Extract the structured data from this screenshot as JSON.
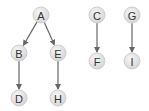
{
  "diagram": {
    "type": "directed-forest",
    "colors": {
      "node_fill": "#e4e4e4",
      "node_stroke": "#cfcfcf",
      "edge": "#666666",
      "label": "#333333"
    },
    "nodes": [
      {
        "id": "A",
        "label": "A",
        "x": 41,
        "y": 15
      },
      {
        "id": "B",
        "label": "B",
        "x": 19,
        "y": 53
      },
      {
        "id": "E",
        "label": "E",
        "x": 58,
        "y": 53
      },
      {
        "id": "D",
        "label": "D",
        "x": 19,
        "y": 98
      },
      {
        "id": "H",
        "label": "H",
        "x": 58,
        "y": 98
      },
      {
        "id": "C",
        "label": "C",
        "x": 97,
        "y": 15
      },
      {
        "id": "F",
        "label": "F",
        "x": 97,
        "y": 61
      },
      {
        "id": "G",
        "label": "G",
        "x": 132,
        "y": 15
      },
      {
        "id": "I",
        "label": "I",
        "x": 132,
        "y": 61
      }
    ],
    "edges": [
      {
        "from": "A",
        "to": "B"
      },
      {
        "from": "A",
        "to": "E"
      },
      {
        "from": "B",
        "to": "D"
      },
      {
        "from": "E",
        "to": "H"
      },
      {
        "from": "C",
        "to": "F"
      },
      {
        "from": "G",
        "to": "I"
      }
    ]
  }
}
